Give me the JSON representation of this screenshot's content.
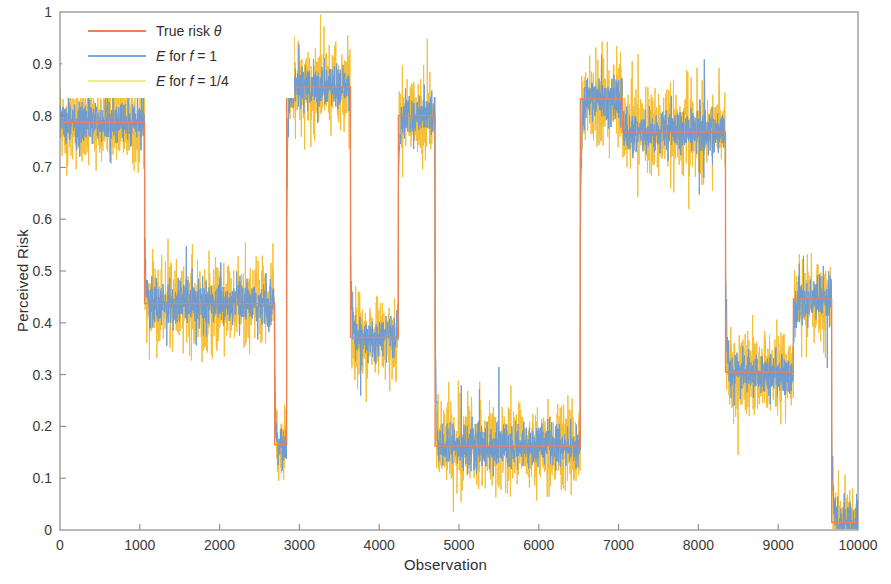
{
  "chart_data": {
    "type": "line",
    "title": "",
    "xlabel": "Observation",
    "ylabel": "Perceived Risk",
    "xlim": [
      0,
      10000
    ],
    "ylim": [
      0,
      1
    ],
    "xticks": [
      0,
      1000,
      2000,
      3000,
      4000,
      5000,
      6000,
      7000,
      8000,
      9000,
      10000
    ],
    "yticks": [
      0,
      0.1,
      0.2,
      0.3,
      0.4,
      0.5,
      0.6,
      0.7,
      0.8,
      0.9,
      1
    ],
    "xticklabels": [
      "0",
      "1000",
      "2000",
      "3000",
      "4000",
      "5000",
      "6000",
      "7000",
      "8000",
      "9000",
      "10000"
    ],
    "yticklabels": [
      "0",
      "0.1",
      "0.2",
      "0.3",
      "0.4",
      "0.5",
      "0.6",
      "0.7",
      "0.8",
      "0.9",
      "1"
    ],
    "grid": false,
    "legend_position": "upper left",
    "legend": [
      {
        "label": "True risk θ",
        "color": "#ED8153",
        "name": "true-risk"
      },
      {
        "label": "E  for f = 1",
        "color": "#7CA8DC",
        "name": "estimate-f-1"
      },
      {
        "label": "E  for f = 1/4",
        "color": "#F0EC8E",
        "name": "estimate-f-quarter"
      }
    ],
    "colors": {
      "true_risk": "#ED8153",
      "estimate_f1": "#6E9BD2",
      "estimate_f14": "#F5BE34",
      "axis": "#7a7a7a",
      "background": "#ffffff"
    },
    "series": [
      {
        "name": "True risk θ",
        "type": "step",
        "color": "#ED8153",
        "steps": [
          {
            "x_start": 0,
            "x_end": 1060,
            "value": 0.787
          },
          {
            "x_start": 1060,
            "x_end": 2690,
            "value": 0.437
          },
          {
            "x_start": 2690,
            "x_end": 2840,
            "value": 0.165
          },
          {
            "x_start": 2840,
            "x_end": 3640,
            "value": 0.855
          },
          {
            "x_start": 3640,
            "x_end": 4240,
            "value": 0.372
          },
          {
            "x_start": 4240,
            "x_end": 4700,
            "value": 0.8
          },
          {
            "x_start": 4700,
            "x_end": 6520,
            "value": 0.162
          },
          {
            "x_start": 6520,
            "x_end": 7050,
            "value": 0.832
          },
          {
            "x_start": 7050,
            "x_end": 8340,
            "value": 0.768
          },
          {
            "x_start": 8340,
            "x_end": 9190,
            "value": 0.305
          },
          {
            "x_start": 9190,
            "x_end": 9670,
            "value": 0.446
          },
          {
            "x_start": 9670,
            "x_end": 10000,
            "value": 0.015
          }
        ]
      },
      {
        "name": "E for f = 1",
        "type": "noisy-step",
        "color": "#6E9BD2",
        "noise_sd": 0.022,
        "tracks": "True risk θ"
      },
      {
        "name": "E for f = 1/4",
        "type": "noisy-step",
        "color": "#F5BE34",
        "noise_sd": 0.042,
        "tracks": "True risk θ"
      }
    ]
  },
  "axes": {
    "x_title": "Observation",
    "y_title": "Perceived Risk"
  }
}
